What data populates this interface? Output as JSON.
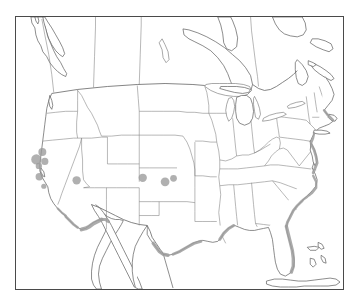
{
  "figure": {
    "type": "distribution-map",
    "region_label": "Continental United States",
    "background_color": "#ffffff",
    "frame_color": "#4a4a4a",
    "boundary_color": "#7d7d7d",
    "coastline_color": "#5c5c5c"
  },
  "legend": {
    "marker_color": "#9a9a9a",
    "coastal_shading_color": "#9c9c9c"
  },
  "chart_data": {
    "type": "scatter",
    "title": "",
    "xlabel": "",
    "ylabel": "",
    "projection": "conic-north-america",
    "grid": false,
    "markers": [
      {
        "name": "marker-ca-north-1",
        "x": 41.5,
        "y": 152.0,
        "r": 4.0
      },
      {
        "name": "marker-ca-north-2",
        "x": 35.5,
        "y": 159.5,
        "r": 5.2
      },
      {
        "name": "marker-ca-north-3",
        "x": 44.0,
        "y": 161.5,
        "r": 3.6
      },
      {
        "name": "marker-ca-north-4",
        "x": 38.0,
        "y": 166.0,
        "r": 3.2
      },
      {
        "name": "marker-ca-central",
        "x": 38.5,
        "y": 177.0,
        "r": 3.8
      },
      {
        "name": "marker-ca-south",
        "x": 43.0,
        "y": 186.5,
        "r": 2.6
      },
      {
        "name": "marker-az-west",
        "x": 76.0,
        "y": 180.5,
        "r": 4.2
      },
      {
        "name": "marker-ks-west",
        "x": 142.5,
        "y": 178.0,
        "r": 4.2
      },
      {
        "name": "marker-ok-north-1",
        "x": 165.0,
        "y": 182.0,
        "r": 4.4
      },
      {
        "name": "marker-ok-north-2",
        "x": 173.5,
        "y": 178.5,
        "r": 3.4
      }
    ],
    "shaded_coast_segments": [
      {
        "name": "pacific-socal-coast",
        "intensity": "medium"
      },
      {
        "name": "baja-border-coast",
        "intensity": "strong"
      },
      {
        "name": "texas-gulf-coast",
        "intensity": "medium"
      },
      {
        "name": "louisiana-gulf-coast",
        "intensity": "light"
      },
      {
        "name": "alabama-gulf-coast",
        "intensity": "medium"
      },
      {
        "name": "florida-atlantic-coast",
        "intensity": "strong"
      },
      {
        "name": "georgia-carolina-coast",
        "intensity": "medium"
      },
      {
        "name": "chesapeake-delmarva-coast",
        "intensity": "strong"
      },
      {
        "name": "newyork-newengland-coast",
        "intensity": "medium"
      }
    ]
  }
}
